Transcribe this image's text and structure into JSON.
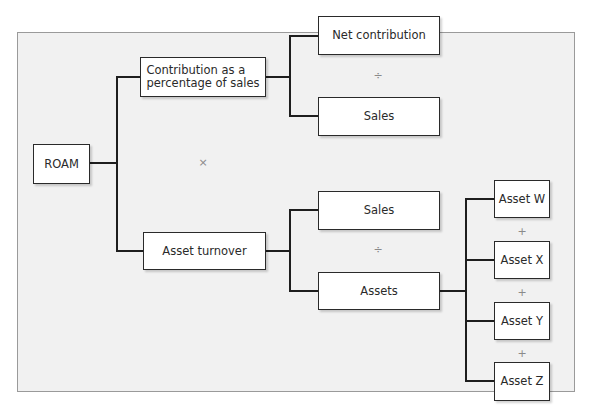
{
  "diagram": {
    "root": {
      "label": "ROAM"
    },
    "level1": [
      {
        "label_line1": "Contribution as a",
        "label_line2": "percentage of sales"
      },
      {
        "label": "Asset turnover"
      }
    ],
    "level1_operator": "×",
    "contribution_children": [
      {
        "label": "Net contribution"
      },
      {
        "label": "Sales"
      }
    ],
    "contribution_operator": "÷",
    "turnover_children": [
      {
        "label": "Sales"
      },
      {
        "label": "Assets"
      }
    ],
    "turnover_operator": "÷",
    "assets_children": [
      {
        "label": "Asset W"
      },
      {
        "label": "Asset X"
      },
      {
        "label": "Asset Y"
      },
      {
        "label": "Asset Z"
      }
    ],
    "assets_operators": [
      "+",
      "+",
      "+"
    ]
  },
  "colors": {
    "panel_background": "#f1f1f1",
    "panel_border": "#9a9a9a",
    "box_border": "#2a2a2a",
    "connector": "#1e1e1e",
    "operator": "#8a8a8a"
  }
}
